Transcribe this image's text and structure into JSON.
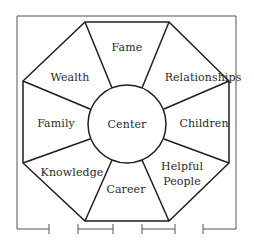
{
  "diagram": {
    "type": "bagua-octagon",
    "center_label": "Center",
    "sectors": [
      {
        "position": "top",
        "label": "Fame"
      },
      {
        "position": "top-right",
        "label": "Relationships"
      },
      {
        "position": "right",
        "label": "Children"
      },
      {
        "position": "bottom-right",
        "label_line1": "Helpful",
        "label_line2": "People"
      },
      {
        "position": "bottom",
        "label": "Career"
      },
      {
        "position": "bottom-left",
        "label": "Knowledge"
      },
      {
        "position": "left",
        "label": "Family"
      },
      {
        "position": "top-left",
        "label": "Wealth"
      }
    ],
    "bottom_entrance_markers": 4,
    "stroke_color": "#1e1e1e",
    "frame_color": "#555555"
  }
}
